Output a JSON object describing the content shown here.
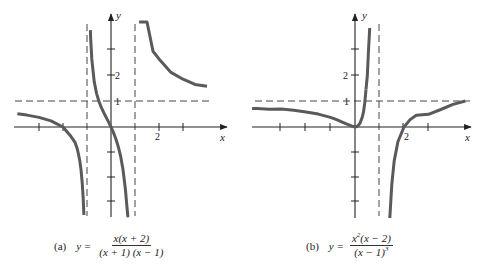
{
  "chart_data": [
    {
      "type": "line",
      "panel_label": "(a)",
      "title": "y = x(x + 2) / ((x + 1)(x − 1))",
      "equation": {
        "lhs": "y =",
        "numerator": "x(x + 2)",
        "denominator": "(x + 1) (x − 1)"
      },
      "xlabel": "x",
      "ylabel": "y",
      "x_tick_labels": [
        {
          "value": 2,
          "label": "2"
        }
      ],
      "y_tick_labels": [
        {
          "value": 1,
          "label": "1"
        },
        {
          "value": 2,
          "label": "2"
        }
      ],
      "x_ticks": [
        -3,
        -2,
        -1,
        0,
        1,
        2,
        3
      ],
      "y_ticks": [
        -3,
        -2,
        -1,
        1,
        2,
        3
      ],
      "xlim": [
        -4.0,
        4.8
      ],
      "ylim": [
        -3.6,
        4.4
      ],
      "vertical_asymptotes": [
        -1,
        1
      ],
      "horizontal_asymptotes": [
        1
      ],
      "series": [
        {
          "name": "left branch",
          "x": [
            -3.9,
            -3.5,
            -3.0,
            -2.5,
            -2.0,
            -1.7,
            -1.5,
            -1.4,
            -1.3,
            -1.25,
            -1.2,
            -1.16,
            -1.13
          ],
          "y": [
            0.52,
            0.467,
            0.375,
            0.238,
            0.0,
            -0.33,
            -0.6,
            -0.875,
            -1.32,
            -1.67,
            -2.18,
            -2.8,
            -3.45
          ]
        },
        {
          "name": "middle branch",
          "x": [
            -0.86,
            -0.85,
            -0.8,
            -0.7,
            -0.6,
            -0.5,
            -0.4,
            -0.3,
            -0.2,
            -0.1,
            0.0,
            0.1,
            0.2,
            0.3,
            0.4,
            0.5,
            0.6,
            0.65,
            0.7,
            0.72
          ],
          "y": [
            3.8,
            3.52,
            2.67,
            1.78,
            1.31,
            1.0,
            0.76,
            0.56,
            0.375,
            0.19,
            0.0,
            -0.21,
            -0.458,
            -0.76,
            -1.14,
            -1.67,
            -2.44,
            -2.99,
            -3.71,
            -3.45
          ]
        },
        {
          "name": "right branch",
          "x": [
            1.17,
            1.2,
            1.3,
            1.4,
            1.5,
            1.75,
            2.0,
            2.5,
            3.0,
            3.5,
            4.0
          ],
          "y": [
            10,
            8.7,
            6.2,
            4.86,
            4.2,
            2.97,
            2.67,
            2.14,
            1.875,
            1.67,
            1.6
          ]
        }
      ]
    },
    {
      "type": "line",
      "panel_label": "(b)",
      "title": "y = x²(x − 2) / (x − 1)³",
      "equation": {
        "lhs": "y =",
        "numerator_base": "x",
        "numerator_exp": "2",
        "numerator_rest": "(x − 2)",
        "denominator_base": "(x − 1)",
        "denominator_exp": "3"
      },
      "xlabel": "x",
      "ylabel": "y",
      "x_tick_labels": [
        {
          "value": 2,
          "label": "2"
        }
      ],
      "y_tick_labels": [
        {
          "value": 1,
          "label": "1"
        },
        {
          "value": 2,
          "label": "2"
        }
      ],
      "x_ticks": [
        -3,
        -2,
        -1,
        0,
        2,
        3
      ],
      "y_ticks": [
        -3,
        -2,
        -1,
        1,
        2,
        3
      ],
      "xlim": [
        -4.2,
        4.8
      ],
      "ylim": [
        -3.6,
        4.4
      ],
      "vertical_asymptotes": [
        1
      ],
      "horizontal_asymptotes": [
        1
      ],
      "series": [
        {
          "name": "left branch",
          "x": [
            -4.2,
            -4.0,
            -3.5,
            -3.0,
            -2.5,
            -2.0,
            -1.5,
            -1.0,
            -0.75,
            -0.5,
            -0.3,
            -0.15,
            0.0,
            0.1,
            0.2,
            0.3,
            0.35,
            0.4,
            0.45
          ],
          "y": [
            0.73,
            0.72,
            0.7,
            0.703,
            0.656,
            0.593,
            0.504,
            0.375,
            0.289,
            0.185,
            0.107,
            0.0445,
            0.0,
            0.026,
            0.14,
            0.402,
            0.61,
            0.96,
            1.48
          ]
        },
        {
          "name": "left branch top",
          "x": [
            0.45,
            0.5,
            0.55,
            0.6
          ],
          "y": [
            1.48,
            2.0,
            3.0,
            4.2
          ]
        },
        {
          "name": "right branch",
          "x": [
            1.42,
            1.5,
            1.6,
            1.75,
            2.0,
            2.25,
            2.5,
            3.0,
            3.5,
            4.0,
            4.5
          ],
          "y": [
            -3.6,
            -2.25,
            -1.33,
            -0.58,
            0.0,
            0.292,
            0.463,
            0.5,
            0.686,
            0.888,
            1.021
          ]
        }
      ]
    }
  ],
  "panels": {
    "a": {
      "label": "(a)",
      "y_axis_label": "y",
      "x_axis_label": "x",
      "tick_2": "2",
      "tick_1": "1",
      "tick_x2": "2"
    },
    "b": {
      "label": "(b)",
      "y_axis_label": "y",
      "x_axis_label": "x",
      "tick_2": "2",
      "tick_1": "1",
      "tick_x2": "2"
    }
  },
  "captions": {
    "a": {
      "label": "(a)",
      "lhs": "y =",
      "numerator": "x(x + 2)",
      "denominator": "(x + 1) (x − 1)"
    },
    "b": {
      "label": "(b)",
      "lhs": "y =",
      "num_base": "x",
      "num_exp": "2",
      "num_rest": "(x − 2)",
      "den_base": "(x − 1)",
      "den_exp": "3"
    }
  },
  "colors": {
    "curve": "#5a5a5a",
    "axis": "#222222",
    "asymptote": "#444444",
    "background": "#ffffff"
  }
}
